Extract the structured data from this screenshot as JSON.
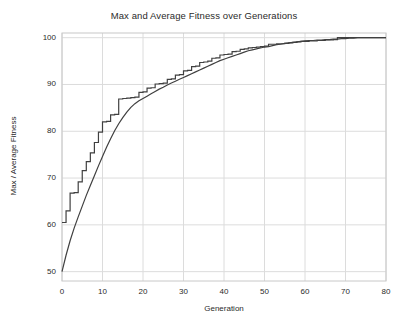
{
  "figure": {
    "width": 408,
    "height": 325,
    "background_color": "#ffffff"
  },
  "chart_data": {
    "type": "line",
    "title": "Max and Average Fitness over Generations",
    "xlabel": "Generation",
    "ylabel": "Max / Average Fitness",
    "xlim": [
      0,
      80
    ],
    "ylim": [
      48,
      101
    ],
    "xticks": [
      0,
      10,
      20,
      30,
      40,
      50,
      60,
      70,
      80
    ],
    "yticks": [
      50,
      60,
      70,
      80,
      90,
      100
    ],
    "grid": true,
    "legend": "none",
    "line_color": "#404040",
    "grid_color": "#dcdcdc",
    "axes_edge_color": "#c8c8c8",
    "x": [
      0,
      1,
      2,
      3,
      4,
      5,
      6,
      7,
      8,
      9,
      10,
      11,
      12,
      13,
      14,
      15,
      16,
      17,
      18,
      19,
      20,
      21,
      22,
      23,
      24,
      25,
      26,
      27,
      28,
      29,
      30,
      31,
      32,
      33,
      34,
      35,
      36,
      37,
      38,
      39,
      40,
      41,
      42,
      43,
      44,
      45,
      46,
      47,
      48,
      49,
      50,
      51,
      52,
      53,
      54,
      55,
      56,
      57,
      58,
      59,
      60,
      61,
      62,
      63,
      64,
      65,
      66,
      67,
      68,
      69,
      70,
      71,
      72,
      73,
      74,
      75,
      76,
      77,
      78,
      79,
      80
    ],
    "series": [
      {
        "name": "Max Fitness",
        "style": "step",
        "values": [
          60.5,
          63.0,
          66.8,
          66.9,
          69.2,
          71.6,
          73.5,
          75.4,
          77.6,
          79.8,
          82.0,
          82.1,
          83.5,
          83.6,
          86.9,
          87.0,
          87.1,
          87.2,
          87.3,
          88.3,
          88.4,
          89.2,
          89.3,
          90.1,
          90.2,
          90.3,
          91.1,
          91.2,
          92.0,
          92.1,
          92.9,
          93.0,
          93.8,
          93.9,
          94.7,
          94.8,
          95.0,
          95.6,
          95.7,
          96.3,
          96.4,
          96.5,
          97.0,
          97.1,
          97.5,
          97.6,
          97.8,
          97.9,
          98.0,
          98.1,
          98.2,
          98.6,
          98.6,
          98.7,
          98.7,
          98.8,
          98.9,
          99.0,
          99.1,
          99.2,
          99.2,
          99.3,
          99.3,
          99.4,
          99.4,
          99.5,
          99.5,
          99.6,
          100.0,
          100.0,
          100.0,
          100.0,
          100.0,
          100.0,
          100.0,
          100.0,
          100.0,
          100.0,
          100.0,
          100.0,
          100.0
        ]
      },
      {
        "name": "Average Fitness",
        "style": "line",
        "values": [
          50.0,
          53.5,
          56.6,
          59.3,
          61.7,
          64.0,
          66.3,
          68.4,
          70.5,
          72.6,
          74.6,
          76.6,
          78.4,
          80.1,
          81.6,
          82.9,
          84.1,
          85.1,
          85.9,
          86.5,
          87.0,
          87.5,
          88.0,
          88.5,
          89.0,
          89.4,
          89.9,
          90.3,
          90.7,
          91.1,
          91.5,
          91.9,
          92.3,
          92.7,
          93.1,
          93.5,
          93.9,
          94.3,
          94.7,
          95.1,
          95.4,
          95.7,
          96.0,
          96.3,
          96.6,
          96.9,
          97.2,
          97.4,
          97.6,
          97.8,
          98.0,
          98.1,
          98.3,
          98.5,
          98.6,
          98.8,
          98.9,
          99.0,
          99.1,
          99.2,
          99.3,
          99.4,
          99.4,
          99.5,
          99.5,
          99.6,
          99.6,
          99.7,
          99.7,
          99.8,
          99.8,
          99.9,
          99.9,
          100.0,
          100.0,
          100.0,
          100.0,
          100.0,
          100.0,
          100.0,
          100.0
        ]
      }
    ]
  },
  "axes_geometry": {
    "left": 62,
    "right": 386,
    "top": 33,
    "bottom": 281
  }
}
